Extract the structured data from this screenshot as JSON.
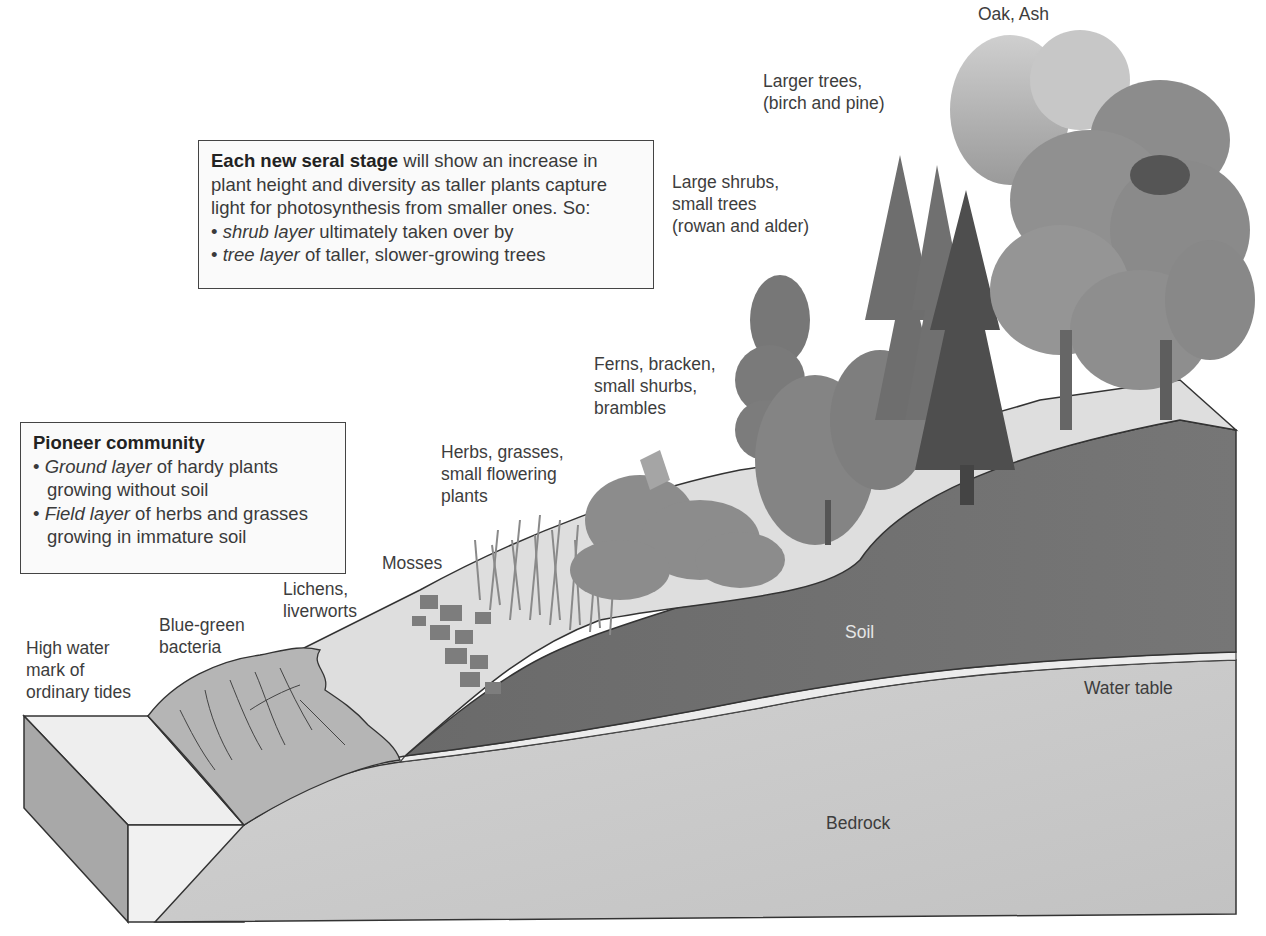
{
  "diagram": {
    "type": "ecological succession (sand dune / coastal primary succession) block diagram",
    "colors": {
      "bedrock": "#c9c9c9",
      "soil": "#6f6f6f",
      "water_table": "#e8e8e8",
      "sand_surface": "#e2e2e2",
      "bacteria_mat": "#b8b8b8",
      "outline": "#333333"
    }
  },
  "boxes": {
    "seral": {
      "title": "Each new seral stage",
      "text": " will show an increase in plant height and diversity as taller plants capture light for photosynthesis from smaller ones. So:",
      "bullets": [
        {
          "em": "shrub layer",
          "rest": " ultimately taken over by"
        },
        {
          "em": "tree layer",
          "rest": " of taller, slower-growing trees"
        }
      ]
    },
    "pioneer": {
      "title": "Pioneer community",
      "bullets": [
        {
          "em": "Ground layer",
          "rest": " of hardy plants growing without soil"
        },
        {
          "em": "Field layer",
          "rest": " of herbs and grasses growing in immature soil"
        }
      ]
    }
  },
  "labels": {
    "oak_ash": "Oak, Ash",
    "larger_trees_1": "Larger trees,",
    "larger_trees_2": "(birch and pine)",
    "large_shrubs_1": "Large shrubs,",
    "large_shrubs_2": "small trees",
    "large_shrubs_3": "(rowan and alder)",
    "ferns_1": "Ferns, bracken,",
    "ferns_2": "small shurbs,",
    "ferns_3": "brambles",
    "herbs_1": "Herbs, grasses,",
    "herbs_2": "small flowering",
    "herbs_3": "plants",
    "mosses": "Mosses",
    "lichens_1": "Lichens,",
    "lichens_2": "liverworts",
    "bacteria_1": "Blue-green",
    "bacteria_2": "bacteria",
    "hwm_1": "High water",
    "hwm_2": "mark of",
    "hwm_3": "ordinary tides",
    "soil": "Soil",
    "water_table": "Water table",
    "bedrock": "Bedrock"
  }
}
